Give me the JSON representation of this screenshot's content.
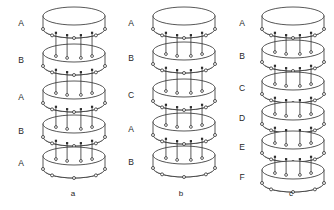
{
  "figure": {
    "background_color": "#ffffff",
    "line_color": "#3a3a3a",
    "node_color": "#2e2e2e",
    "text_color": "#262626",
    "width": 334,
    "height": 210
  },
  "panels": [
    {
      "id": "a",
      "caption": "a",
      "caption_x": 73,
      "caption_y": 196,
      "label_x": 21,
      "center_x": 74,
      "disc_rx": 31,
      "disc_ry": 9,
      "disc_height": 13,
      "layers": [
        {
          "label": "A",
          "y": 16
        },
        {
          "label": "B",
          "y": 53
        },
        {
          "label": "A",
          "y": 90
        },
        {
          "label": "B",
          "y": 124
        },
        {
          "label": "A",
          "y": 156
        }
      ],
      "rod_count": 4,
      "rim_nodes": 5
    },
    {
      "id": "b",
      "caption": "b",
      "caption_x": 181,
      "caption_y": 196,
      "label_x": 131,
      "center_x": 184,
      "disc_rx": 31,
      "disc_ry": 9,
      "disc_height": 13,
      "layers": [
        {
          "label": "A",
          "y": 16
        },
        {
          "label": "B",
          "y": 51
        },
        {
          "label": "C",
          "y": 88
        },
        {
          "label": "A",
          "y": 122
        },
        {
          "label": "B",
          "y": 155
        }
      ],
      "rod_count": 4,
      "rim_nodes": 5
    },
    {
      "id": "c",
      "caption": "c",
      "caption_x": 291,
      "caption_y": 196,
      "label_x": 242,
      "center_x": 293,
      "disc_rx": 31,
      "disc_ry": 9,
      "disc_height": 13,
      "layers": [
        {
          "label": "A",
          "y": 16
        },
        {
          "label": "B",
          "y": 49
        },
        {
          "label": "C",
          "y": 81
        },
        {
          "label": "D",
          "y": 111
        },
        {
          "label": "E",
          "y": 140
        },
        {
          "label": "F",
          "y": 170
        }
      ],
      "rod_count": 4,
      "rim_nodes": 5
    }
  ]
}
